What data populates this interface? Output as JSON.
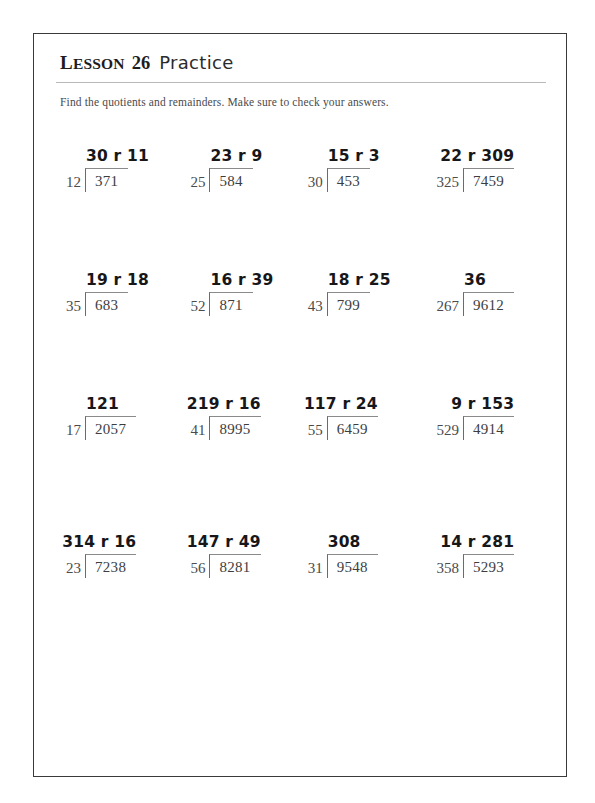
{
  "header": {
    "lesson_label": "Lesson",
    "lesson_number": "26",
    "section_label": "Practice"
  },
  "instructions": "Find the quotients and remainders. Make sure to check your answers.",
  "colors": {
    "page_border": "#3a3a3c",
    "rule": "#b9b9b9",
    "printed_text": "#3d3d3f",
    "answer_text": "#171719"
  },
  "problem_rows": [
    {
      "problems": [
        {
          "divisor": "12",
          "dividend": "371",
          "quotient": "30 r 11",
          "wide": false
        },
        {
          "divisor": "25",
          "dividend": "584",
          "quotient": "23 r 9",
          "wide": false
        },
        {
          "divisor": "30",
          "dividend": "453",
          "quotient": "15 r 3",
          "wide": false
        },
        {
          "divisor": "325",
          "dividend": "7459",
          "quotient": "22 r 309",
          "wide": true
        }
      ]
    },
    {
      "problems": [
        {
          "divisor": "35",
          "dividend": "683",
          "quotient": "19 r 18",
          "wide": false
        },
        {
          "divisor": "52",
          "dividend": "871",
          "quotient": "16 r 39",
          "wide": false
        },
        {
          "divisor": "43",
          "dividend": "799",
          "quotient": "18 r 25",
          "wide": false
        },
        {
          "divisor": "267",
          "dividend": "9612",
          "quotient": "36",
          "wide": false
        }
      ]
    },
    {
      "problems": [
        {
          "divisor": "17",
          "dividend": "2057",
          "quotient": "121",
          "wide": false
        },
        {
          "divisor": "41",
          "dividend": "8995",
          "quotient": "219 r 16",
          "wide": true
        },
        {
          "divisor": "55",
          "dividend": "6459",
          "quotient": "117 r 24",
          "wide": true
        },
        {
          "divisor": "529",
          "dividend": "4914",
          "quotient": "9 r 153",
          "wide": true
        }
      ]
    },
    {
      "problems": [
        {
          "divisor": "23",
          "dividend": "7238",
          "quotient": "314 r 16",
          "wide": true
        },
        {
          "divisor": "56",
          "dividend": "8281",
          "quotient": "147 r 49",
          "wide": true
        },
        {
          "divisor": "31",
          "dividend": "9548",
          "quotient": "308",
          "wide": false
        },
        {
          "divisor": "358",
          "dividend": "5293",
          "quotient": "14 r 281",
          "wide": true
        }
      ]
    }
  ]
}
